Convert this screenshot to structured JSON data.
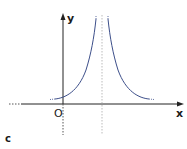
{
  "figure": {
    "panel_label": "c",
    "axes": {
      "x_label": "x",
      "y_label": "y",
      "origin_label": "O"
    },
    "curve_color": "#3d4f8a",
    "axis_color": "#222222",
    "asymptote_color": "#aaaaaa"
  }
}
